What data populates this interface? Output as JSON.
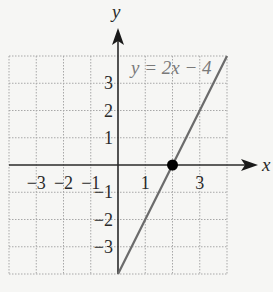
{
  "chart_data": {
    "type": "line",
    "title": "",
    "equation_label": "y = 2x − 4",
    "xlabel": "x",
    "ylabel": "y",
    "xlim": [
      -4,
      4
    ],
    "ylim": [
      -4,
      4
    ],
    "grid": true,
    "x_tick_labels": [
      "−3",
      "−2",
      "−1",
      "1",
      "3"
    ],
    "x_tick_values": [
      -3,
      -2,
      -1,
      1,
      3
    ],
    "y_tick_labels": [
      "3",
      "2",
      "1",
      "−1",
      "−2",
      "−3"
    ],
    "y_tick_values": [
      3,
      2,
      1,
      -1,
      -2,
      -3
    ],
    "series": [
      {
        "name": "y = 2x − 4",
        "x": [
          0,
          4
        ],
        "y": [
          -4,
          4
        ],
        "color": "#6b6b6b"
      }
    ],
    "highlighted_points": [
      {
        "x": 2,
        "y": 0,
        "label": "x-intercept",
        "color": "#000000"
      }
    ]
  },
  "colors": {
    "axis": "#2a2a2a",
    "grid": "#a8a8a8",
    "line": "#6b6b6b",
    "label": "#2a2a2a",
    "equation": "#7a7a7a",
    "background": "#f6f6f4"
  }
}
